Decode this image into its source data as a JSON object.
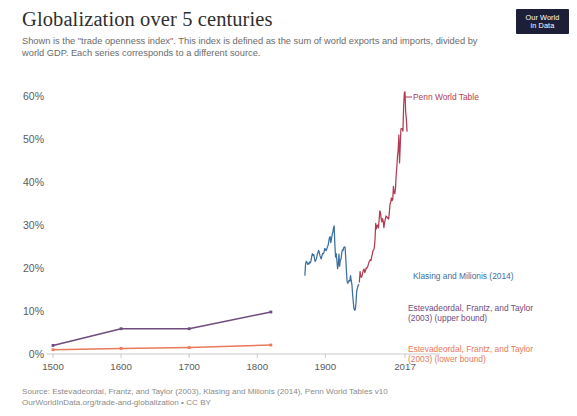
{
  "header": {
    "title": "Globalization over 5 centuries",
    "subtitle": "Shown is the \"trade openness index\". This index is defined as the sum of world exports and imports, divided by world GDP. Each series corresponds to a different source.",
    "logo_line1": "Our World",
    "logo_line2": "in Data"
  },
  "footer": {
    "source": "Source: Estevadeordal, Frantz, and Taylor (2003), Klasing and Milionis (2014), Penn World Tables v10",
    "license": "OurWorldInData.org/trade-and-globalization • CC BY"
  },
  "colors": {
    "penn_world_table": "#b13b52",
    "klasing_milionis": "#3c6e9e",
    "eft_upper": "#6f4b7e",
    "eft_lower": "#e8795a",
    "axis": "#c9c9c9",
    "tick_text": "#5b5b5b",
    "logo_bg": "#1d1f38"
  },
  "chart_data": {
    "type": "line",
    "title": "Globalization over 5 centuries",
    "subtitle": "Shown is the \"trade openness index\". This index is defined as the sum of world exports and imports, divided by world GDP. Each series corresponds to a different source.",
    "xlabel": "",
    "ylabel": "",
    "xlim": [
      1490,
      2022
    ],
    "ylim": [
      0,
      63
    ],
    "grid": false,
    "legend_position": "right-inline",
    "yticks": [
      0,
      10,
      20,
      30,
      40,
      50,
      60
    ],
    "ytick_labels": [
      "0%",
      "10%",
      "20%",
      "30%",
      "40%",
      "50%",
      "60%"
    ],
    "xticks": [
      1500,
      1600,
      1700,
      1800,
      1900,
      2017
    ],
    "xtick_labels": [
      "1500",
      "1600",
      "1700",
      "1800",
      "1900",
      "2017"
    ],
    "series": [
      {
        "name": "Estevadeordal, Frantz, and Taylor (2003) (upper bound)",
        "key": "eft_upper",
        "color": "#6f4b7e",
        "label_lines": [
          "Estevadeordal, Frantz, and Taylor",
          "(2003) (upper bound)"
        ],
        "points": [
          [
            1500,
            2.0
          ],
          [
            1600,
            5.9
          ],
          [
            1700,
            5.9
          ],
          [
            1820,
            9.8
          ]
        ]
      },
      {
        "name": "Estevadeordal, Frantz, and Taylor (2003) (lower bound)",
        "key": "eft_lower",
        "color": "#e8795a",
        "label_lines": [
          "Estevadeordal, Frantz, and Taylor",
          "(2003) (lower bound)"
        ],
        "points": [
          [
            1500,
            1.0
          ],
          [
            1600,
            1.3
          ],
          [
            1700,
            1.5
          ],
          [
            1820,
            2.1
          ]
        ]
      },
      {
        "name": "Klasing and Milionis (2014)",
        "key": "klasing_milionis",
        "color": "#3c6e9e",
        "label_lines": [
          "Klasing and Milionis (2014)"
        ],
        "points": [
          [
            1870,
            18.4
          ],
          [
            1871,
            21.1
          ],
          [
            1872,
            21.6
          ],
          [
            1873,
            21.4
          ],
          [
            1874,
            20.9
          ],
          [
            1875,
            21.2
          ],
          [
            1876,
            21.0
          ],
          [
            1877,
            21.5
          ],
          [
            1878,
            21.3
          ],
          [
            1879,
            21.8
          ],
          [
            1880,
            22.8
          ],
          [
            1881,
            23.4
          ],
          [
            1882,
            23.0
          ],
          [
            1883,
            23.2
          ],
          [
            1884,
            22.3
          ],
          [
            1885,
            21.6
          ],
          [
            1886,
            21.9
          ],
          [
            1887,
            22.3
          ],
          [
            1888,
            23.1
          ],
          [
            1889,
            23.6
          ],
          [
            1890,
            24.2
          ],
          [
            1891,
            23.8
          ],
          [
            1892,
            23.0
          ],
          [
            1893,
            22.5
          ],
          [
            1894,
            22.2
          ],
          [
            1895,
            22.9
          ],
          [
            1896,
            23.5
          ],
          [
            1897,
            23.4
          ],
          [
            1898,
            23.7
          ],
          [
            1899,
            24.6
          ],
          [
            1900,
            24.5
          ],
          [
            1901,
            24.1
          ],
          [
            1902,
            24.4
          ],
          [
            1903,
            25.0
          ],
          [
            1904,
            25.3
          ],
          [
            1905,
            26.2
          ],
          [
            1906,
            27.1
          ],
          [
            1907,
            27.4
          ],
          [
            1908,
            26.0
          ],
          [
            1909,
            26.8
          ],
          [
            1910,
            27.8
          ],
          [
            1911,
            28.4
          ],
          [
            1912,
            29.4
          ],
          [
            1913,
            29.9
          ],
          [
            1914,
            25.5
          ],
          [
            1915,
            22.6
          ],
          [
            1916,
            23.4
          ],
          [
            1917,
            21.8
          ],
          [
            1918,
            19.9
          ],
          [
            1919,
            20.8
          ],
          [
            1920,
            23.3
          ],
          [
            1921,
            20.5
          ],
          [
            1922,
            21.9
          ],
          [
            1923,
            22.1
          ],
          [
            1924,
            23.4
          ],
          [
            1925,
            24.3
          ],
          [
            1926,
            24.1
          ],
          [
            1927,
            24.8
          ],
          [
            1928,
            25.0
          ],
          [
            1929,
            24.9
          ],
          [
            1930,
            22.3
          ],
          [
            1931,
            19.4
          ],
          [
            1932,
            16.9
          ],
          [
            1933,
            16.5
          ],
          [
            1934,
            16.8
          ],
          [
            1935,
            17.2
          ],
          [
            1936,
            17.0
          ],
          [
            1937,
            18.3
          ],
          [
            1938,
            17.1
          ],
          [
            1939,
            16.3
          ],
          [
            1940,
            14.0
          ],
          [
            1941,
            12.2
          ],
          [
            1942,
            10.6
          ],
          [
            1943,
            10.2
          ],
          [
            1944,
            10.4
          ],
          [
            1945,
            11.9
          ],
          [
            1946,
            14.6
          ],
          [
            1947,
            15.3
          ],
          [
            1948,
            15.9
          ],
          [
            1949,
            16.2
          ]
        ]
      },
      {
        "name": "Penn World Table",
        "key": "penn_world_table",
        "color": "#b13b52",
        "label_lines": [
          "Penn World Table"
        ],
        "points": [
          [
            1950,
            16.8
          ],
          [
            1951,
            19.2
          ],
          [
            1952,
            18.1
          ],
          [
            1953,
            17.9
          ],
          [
            1954,
            18.3
          ],
          [
            1955,
            19.0
          ],
          [
            1956,
            19.6
          ],
          [
            1957,
            19.8
          ],
          [
            1958,
            19.0
          ],
          [
            1959,
            19.4
          ],
          [
            1960,
            20.1
          ],
          [
            1961,
            20.0
          ],
          [
            1962,
            20.3
          ],
          [
            1963,
            20.8
          ],
          [
            1964,
            21.4
          ],
          [
            1965,
            21.7
          ],
          [
            1966,
            22.0
          ],
          [
            1967,
            21.8
          ],
          [
            1968,
            22.7
          ],
          [
            1969,
            23.3
          ],
          [
            1970,
            24.1
          ],
          [
            1971,
            24.3
          ],
          [
            1972,
            24.9
          ],
          [
            1973,
            26.8
          ],
          [
            1974,
            30.5
          ],
          [
            1975,
            29.2
          ],
          [
            1976,
            30.0
          ],
          [
            1977,
            30.1
          ],
          [
            1978,
            29.4
          ],
          [
            1979,
            31.2
          ],
          [
            1980,
            33.4
          ],
          [
            1981,
            33.0
          ],
          [
            1982,
            31.6
          ],
          [
            1983,
            30.8
          ],
          [
            1984,
            31.6
          ],
          [
            1985,
            31.0
          ],
          [
            1986,
            29.5
          ],
          [
            1987,
            30.6
          ],
          [
            1988,
            31.4
          ],
          [
            1989,
            32.2
          ],
          [
            1990,
            32.1
          ],
          [
            1991,
            31.7
          ],
          [
            1992,
            31.9
          ],
          [
            1993,
            31.5
          ],
          [
            1994,
            33.0
          ],
          [
            1995,
            35.0
          ],
          [
            1996,
            35.4
          ],
          [
            1997,
            36.4
          ],
          [
            1998,
            35.8
          ],
          [
            1999,
            36.0
          ],
          [
            2000,
            39.1
          ],
          [
            2001,
            37.6
          ],
          [
            2002,
            37.4
          ],
          [
            2003,
            38.6
          ],
          [
            2004,
            41.6
          ],
          [
            2005,
            43.7
          ],
          [
            2006,
            46.2
          ],
          [
            2007,
            47.6
          ],
          [
            2008,
            51.1
          ],
          [
            2009,
            44.6
          ],
          [
            2010,
            48.6
          ],
          [
            2011,
            52.5
          ],
          [
            2012,
            52.6
          ],
          [
            2013,
            52.5
          ],
          [
            2014,
            52.0
          ],
          [
            2015,
            57.8
          ],
          [
            2016,
            60.9
          ],
          [
            2017,
            61.2
          ],
          [
            2018,
            56.4
          ],
          [
            2019,
            54.8
          ],
          [
            2020,
            52.0
          ]
        ]
      }
    ]
  }
}
